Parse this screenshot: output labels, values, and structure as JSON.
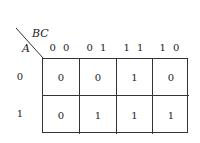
{
  "kmap": {
    "col_var": "BC",
    "row_var": "A",
    "col_headers": [
      "0 0",
      "0 1",
      "1 1",
      "1 0"
    ],
    "row_headers": [
      "0",
      "1"
    ],
    "rows": [
      [
        "0",
        "0",
        "1",
        "0"
      ],
      [
        "0",
        "1",
        "1",
        "1"
      ]
    ]
  }
}
